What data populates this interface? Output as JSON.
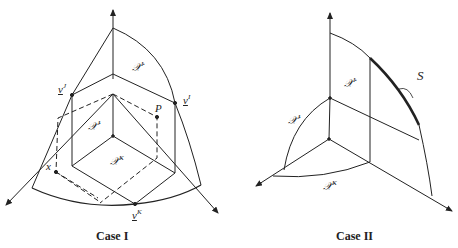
{
  "figures": [
    {
      "caption": "Case I",
      "labels": {
        "region_I": {
          "base": "𝒳",
          "sup": "I"
        },
        "region_J": {
          "base": "𝒳",
          "sup": "J"
        },
        "region_K": {
          "base": "𝒳",
          "sup": "K"
        },
        "vertex_J": {
          "base": "v",
          "sup": "J"
        },
        "vertex_I": {
          "base": "v",
          "sup": "I"
        },
        "vertex_K": {
          "base": "v",
          "sup": "K"
        },
        "point_P": "P",
        "point_x": "x"
      }
    },
    {
      "caption": "Case II",
      "labels": {
        "region_I": {
          "base": "𝒳",
          "sup": "I"
        },
        "region_J": {
          "base": "𝒳",
          "sup": "J"
        },
        "region_K": {
          "base": "𝒳",
          "sup": "K"
        },
        "curve_S": "S"
      }
    }
  ],
  "colors": {
    "line": "#222222",
    "background": "#ffffff"
  }
}
